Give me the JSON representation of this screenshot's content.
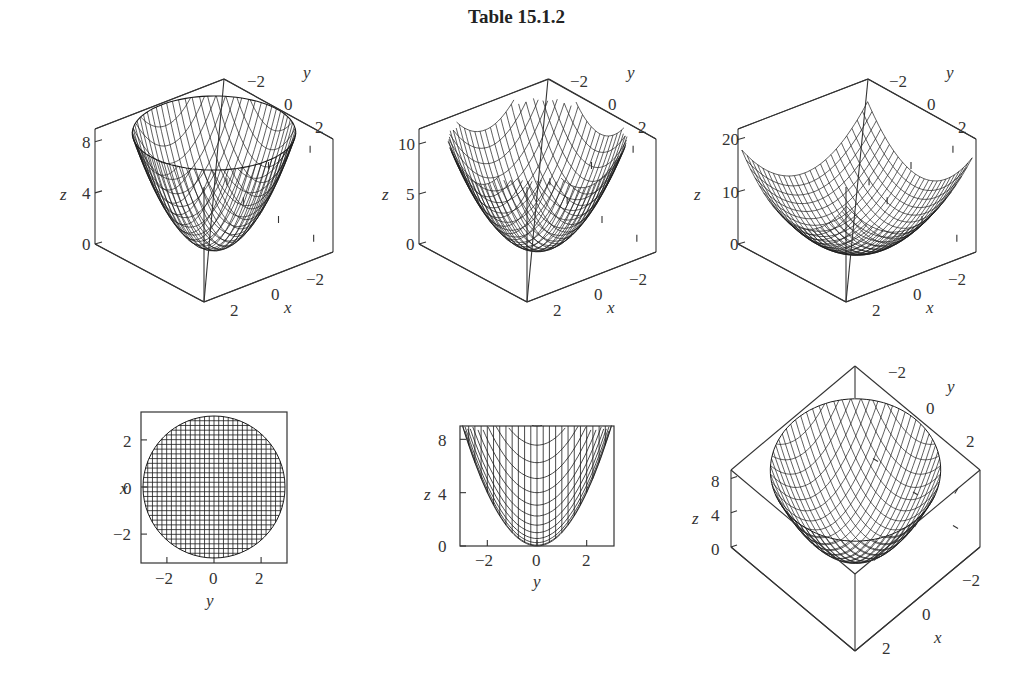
{
  "title": "Table 15.1.2",
  "colors": {
    "line": "#1a1a1a",
    "box": "#333333",
    "text": "#333333",
    "background": "#ffffff"
  },
  "chart_data": [
    {
      "type": "surface3d",
      "title": "",
      "function": "z = x^2 + y^2 (disk domain)",
      "domain": "disk",
      "xlabel": "x",
      "ylabel": "y",
      "zlabel": "z",
      "xticks": [
        "2",
        "0",
        "−2"
      ],
      "yticks": [
        "−2",
        "0",
        "2"
      ],
      "zticks": [
        "0",
        "4",
        "8"
      ],
      "zrange": [
        0,
        9
      ],
      "box": {
        "top_back": [
          224,
          79
        ],
        "left_top": [
          95,
          129
        ],
        "right_top": [
          333,
          139
        ],
        "left_bottom": [
          95,
          244
        ],
        "front_bottom": [
          204,
          302
        ],
        "right_bottom": [
          333,
          252
        ]
      },
      "zlabel_pos": [
        60,
        200
      ],
      "zticks_pos": [
        [
          82,
          249
        ],
        [
          82,
          199
        ],
        [
          82,
          149
        ]
      ],
      "yticks_pos": [
        [
          247,
          87
        ],
        [
          284,
          110
        ],
        [
          315,
          133
        ]
      ],
      "ylabel_pos": [
        303,
        78
      ],
      "xticks_pos": [
        [
          230,
          316
        ],
        [
          271,
          300
        ],
        [
          306,
          285
        ]
      ],
      "xlabel_pos": [
        284,
        313
      ]
    },
    {
      "type": "surface3d",
      "title": "",
      "function": "z = x^2 + y^2 (square domain, cropped)",
      "domain": "square",
      "xlabel": "x",
      "ylabel": "y",
      "zlabel": "z",
      "xticks": [
        "2",
        "0",
        "−2"
      ],
      "yticks": [
        "−2",
        "0",
        "2"
      ],
      "zticks": [
        "0",
        "5",
        "10"
      ],
      "zrange": [
        0,
        11.5
      ],
      "box": {
        "top_back": [
          549,
          79
        ],
        "left_top": [
          419,
          129
        ],
        "right_top": [
          656,
          139
        ],
        "left_bottom": [
          419,
          244
        ],
        "front_bottom": [
          527,
          302
        ],
        "right_bottom": [
          656,
          252
        ]
      },
      "zlabel_pos": [
        382,
        200
      ],
      "zticks_pos": [
        [
          406,
          249
        ],
        [
          406,
          199
        ],
        [
          406,
          149
        ]
      ],
      "yticks_pos": [
        [
          570,
          87
        ],
        [
          608,
          110
        ],
        [
          638,
          133
        ]
      ],
      "ylabel_pos": [
        627,
        78
      ],
      "xticks_pos": [
        [
          553,
          316
        ],
        [
          594,
          300
        ],
        [
          629,
          285
        ]
      ],
      "xlabel_pos": [
        607,
        313
      ]
    },
    {
      "type": "surface3d",
      "title": "",
      "function": "z = x^2 + y^2 (square domain, full)",
      "domain": "square-full",
      "xlabel": "x",
      "ylabel": "y",
      "zlabel": "z",
      "xticks": [
        "2",
        "0",
        "−2"
      ],
      "yticks": [
        "−2",
        "0",
        "2"
      ],
      "zticks": [
        "0",
        "10",
        "20"
      ],
      "zrange": [
        0,
        22
      ],
      "box": {
        "top_back": [
          868,
          79
        ],
        "left_top": [
          738,
          129
        ],
        "right_top": [
          976,
          139
        ],
        "left_bottom": [
          738,
          244
        ],
        "front_bottom": [
          846,
          302
        ],
        "right_bottom": [
          976,
          252
        ]
      },
      "zlabel_pos": [
        694,
        200
      ],
      "zticks_pos": [
        [
          730,
          249
        ],
        [
          730,
          199
        ],
        [
          730,
          149
        ]
      ],
      "yticks_pos": [
        [
          889,
          87
        ],
        [
          927,
          110
        ],
        [
          958,
          133
        ]
      ],
      "ylabel_pos": [
        946,
        78
      ],
      "xticks_pos": [
        [
          872,
          316
        ],
        [
          913,
          300
        ],
        [
          948,
          285
        ]
      ],
      "xlabel_pos": [
        926,
        313
      ]
    },
    {
      "type": "contour_topview",
      "title": "",
      "function": "z = x^2 + y^2 viewed from above (x-y projection)",
      "xlabel": "y",
      "ylabel": "x",
      "xticks": [
        "−2",
        "0",
        "2"
      ],
      "yticks": [
        "2",
        "0",
        "−2"
      ],
      "xrange": [
        -3.1,
        3.1
      ],
      "yrange": [
        -3.1,
        3.1
      ],
      "frame": [
        141,
        412,
        287,
        563
      ],
      "circle": {
        "cx": 214,
        "cy": 487,
        "r": 71
      },
      "grid_lines": 30
    },
    {
      "type": "side_view",
      "title": "",
      "function": "z = x^2 + y^2 viewed along x (y-z projection)",
      "xlabel": "y",
      "ylabel": "z",
      "xticks": [
        "−2",
        "0",
        "2"
      ],
      "yticks": [
        "0",
        "4",
        "8"
      ],
      "xrange": [
        -3.1,
        3.1
      ],
      "yrange": [
        0,
        9
      ],
      "frame": [
        460,
        426,
        614,
        546
      ]
    },
    {
      "type": "surface3d_topdown",
      "title": "",
      "function": "z = x^2 + y^2 viewed from high elevation",
      "xlabel": "x",
      "ylabel": "y",
      "zlabel": "z",
      "xticks": [
        "2",
        "0",
        "−2"
      ],
      "yticks": [
        "−2",
        "0",
        "2"
      ],
      "zticks": [
        "0",
        "4",
        "8"
      ],
      "box": {
        "top": [
          855,
          366
        ],
        "left_top": [
          731,
          470
        ],
        "right_top": [
          980,
          470
        ],
        "left_bottom": [
          731,
          547
        ],
        "right_bottom": [
          980,
          547
        ],
        "front_bottom": [
          855,
          651
        ],
        "front_top": [
          855,
          574
        ]
      }
    }
  ],
  "panels": {
    "p4": {
      "ylabel": "x",
      "xlabel": "y",
      "xticks": [
        "−2",
        "0",
        "2"
      ],
      "yticks": [
        "2",
        "0",
        "−2"
      ]
    },
    "p5": {
      "ylabel": "z",
      "xlabel": "y",
      "xticks": [
        "−2",
        "0",
        "2"
      ],
      "yticks": [
        "8",
        "4",
        "0"
      ]
    },
    "p6": {
      "zlabel": "z",
      "zticks": [
        "8",
        "4",
        "0"
      ],
      "yticks": [
        "−2",
        "0",
        "2"
      ],
      "ylabel": "y",
      "xticks": [
        "−2",
        "0",
        "2"
      ],
      "xlabel": "x"
    }
  }
}
